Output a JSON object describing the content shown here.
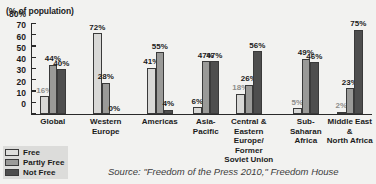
{
  "chart_data": {
    "type": "bar",
    "title": "",
    "subtitle": "",
    "axis_caption": "(% of population)",
    "xlabel": "",
    "ylabel": "",
    "ylim": [
      0,
      80
    ],
    "ytick_labels": [
      "80%",
      "70",
      "60",
      "50",
      "40",
      "30",
      "20",
      "10",
      "0"
    ],
    "ytick_values": [
      80,
      70,
      60,
      50,
      40,
      30,
      20,
      10,
      0
    ],
    "grid": false,
    "legend_position": "bottom-left",
    "categories": [
      "Global",
      "Western\nEurope",
      "Americas",
      "Asia-\nPacific",
      "Central &\nEastern Europe/\nFormer\nSoviet Union",
      "Sub-\nSaharan\nAfrica",
      "Middle East\n&\nNorth Africa"
    ],
    "series": [
      {
        "name": "Free",
        "color": "#d8d8d6",
        "values": [
          16,
          72,
          41,
          6,
          18,
          5,
          2
        ]
      },
      {
        "name": "Partly Free",
        "color": "#9a9a98",
        "values": [
          44,
          28,
          55,
          47,
          26,
          49,
          23
        ]
      },
      {
        "name": "Not Free",
        "color": "#4e4e4e",
        "values": [
          40,
          0,
          4,
          47,
          56,
          46,
          75
        ]
      }
    ],
    "data_labels": [
      [
        "16%",
        "44%",
        "40%"
      ],
      [
        "72%",
        "28%",
        "0%"
      ],
      [
        "41%",
        "55%",
        "4%"
      ],
      [
        "6%",
        "47%",
        "47%"
      ],
      [
        "18%",
        "26%",
        "56%"
      ],
      [
        "5%",
        "49%",
        "46%"
      ],
      [
        "2%",
        "23%",
        "75%"
      ]
    ],
    "source": "Source: \"Freedom of the Press 2010,\" Freedom House"
  },
  "legend": {
    "items": [
      {
        "label": "Free"
      },
      {
        "label": "Partly Free"
      },
      {
        "label": "Not Free"
      }
    ]
  },
  "source_note": "Source: \"Freedom of the Press 2010,\" Freedom House"
}
